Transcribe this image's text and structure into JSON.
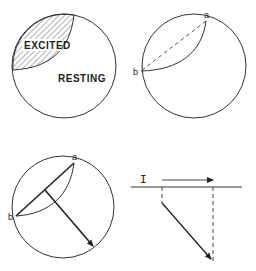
{
  "diagram": {
    "panels": [
      {
        "id": "panel-1",
        "labels": {
          "excited": "EXCITED",
          "resting": "RESTING"
        }
      },
      {
        "id": "panel-2",
        "labels": {
          "point_a": "a",
          "point_b": "b"
        }
      },
      {
        "id": "panel-3",
        "labels": {
          "point_a": "a",
          "point_b": "b"
        }
      },
      {
        "id": "panel-4",
        "labels": {
          "current": "I"
        }
      }
    ],
    "colors": {
      "stroke": "#333333",
      "background": "#ffffff"
    }
  }
}
